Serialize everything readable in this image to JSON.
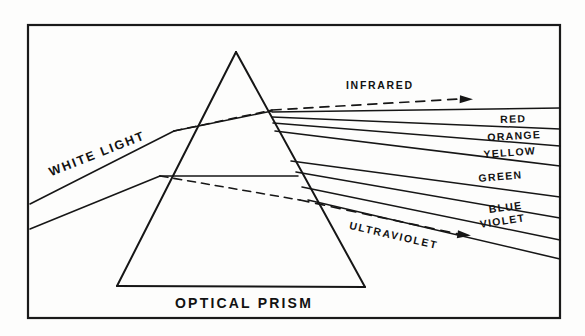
{
  "figure": {
    "title": "OPTICAL PRISM",
    "caption": "OPTICAL PRISM",
    "ink_color": "#161616",
    "background_color": "#fdfdfc"
  },
  "beams": {
    "incoming": {
      "label": "WHITE LIGHT"
    },
    "invisible_bands": [
      {
        "name": "infrared",
        "label": "INFRARED"
      },
      {
        "name": "ultraviolet",
        "label": "ULTRAVIOLET"
      }
    ]
  },
  "spectrum": {
    "labels": [
      {
        "name": "red",
        "label": "RED"
      },
      {
        "name": "orange",
        "label": "ORANGE"
      },
      {
        "name": "yellow",
        "label": "YELLOW"
      },
      {
        "name": "green",
        "label": "GREEN"
      },
      {
        "name": "blue",
        "label": "BLUE"
      },
      {
        "name": "violet",
        "label": "VIOLET"
      }
    ]
  }
}
